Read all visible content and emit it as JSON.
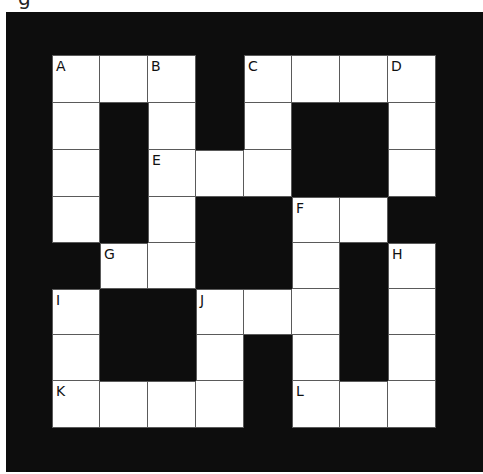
{
  "caption_fragment": "g",
  "crossword": {
    "rows": 8,
    "cols": 8,
    "colors": {
      "frame": "#0d0d0d",
      "cell": "#ffffff",
      "grid_line": "#5a5a5a",
      "label": "#111111"
    },
    "layout": [
      "WWWXWWWW",
      "WXWXWXXW",
      "WXWWWXXW",
      "WXWXXWWX",
      "XWWXXWXW",
      "WXXWWWXW",
      "WXXWXWXW",
      "WWWWXWWW"
    ],
    "labels": [
      {
        "row": 0,
        "col": 0,
        "text": "A"
      },
      {
        "row": 0,
        "col": 2,
        "text": "B"
      },
      {
        "row": 0,
        "col": 4,
        "text": "C"
      },
      {
        "row": 0,
        "col": 7,
        "text": "D"
      },
      {
        "row": 2,
        "col": 2,
        "text": "E"
      },
      {
        "row": 3,
        "col": 5,
        "text": "F"
      },
      {
        "row": 4,
        "col": 1,
        "text": "G"
      },
      {
        "row": 4,
        "col": 7,
        "text": "H"
      },
      {
        "row": 5,
        "col": 0,
        "text": "I"
      },
      {
        "row": 5,
        "col": 3,
        "text": "J"
      },
      {
        "row": 7,
        "col": 0,
        "text": "K"
      },
      {
        "row": 7,
        "col": 5,
        "text": "L"
      }
    ]
  }
}
